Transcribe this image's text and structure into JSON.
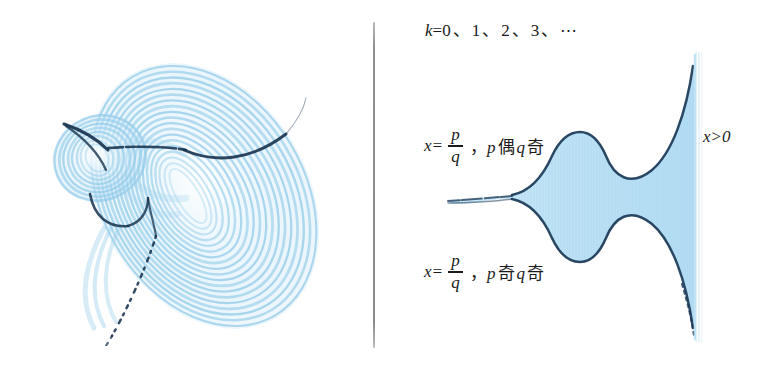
{
  "figure": {
    "title_label": "k=0、1、2、3、⋯",
    "divider": {
      "orientation": "vertical",
      "color": "#8f8f8f"
    },
    "colors": {
      "fill_light_blue": "#c5e4f5",
      "band_blue": "#8ec9e8",
      "outline_dark_navy": "#17324e",
      "background": "#ffffff",
      "text": "#1a1a1a",
      "divider_gray": "#8f8f8f"
    },
    "k_sequence": {
      "variable": "k",
      "equals": "=",
      "values": [
        "0",
        "1",
        "2",
        "3"
      ],
      "separator": "、",
      "ellipsis": "⋯"
    },
    "left_figure": {
      "name": "strange-attractor",
      "description": "Lorenz-type strange attractor with concentric light blue spiral bands and dark navy trajectory curves"
    },
    "right_figure": {
      "name": "horn-region",
      "description": "Symmetric horn shaped region with pale blue fill and dark navy outline",
      "edge_label": "x>0"
    },
    "labels": {
      "even_odd": {
        "lhs": "x",
        "equals": "=",
        "numerator": "p",
        "denominator": "q",
        "separator": "，",
        "p_var": "p",
        "p_parity": "偶",
        "q_var": "q",
        "q_parity": "奇"
      },
      "odd_odd": {
        "lhs": "x",
        "equals": "=",
        "numerator": "p",
        "denominator": "q",
        "separator": "，",
        "p_var": "p",
        "p_parity": "奇",
        "q_var": "q",
        "q_parity": "奇"
      },
      "x_positive": "x>0"
    }
  }
}
